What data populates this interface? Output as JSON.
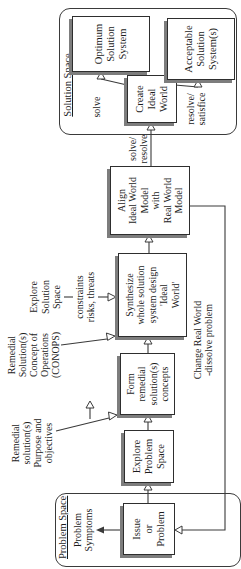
{
  "diagram": {
    "problem_space": {
      "title": "Problem Space"
    },
    "solution_space": {
      "title": "Solution Space"
    },
    "boxes": {
      "issue": "Issue\nor\nProblem",
      "explore_problem": "Explore\nProblem\nSpace",
      "form": "Form\nremedial\nsolution(s)\nconcepts",
      "synthesize": "Synthesize\nwhole solution\nsystem design\n'Ideal\nWorld'",
      "align": "Align\nIdeal World\nModel\nwith\nReal World\nModel",
      "create": "Create\nIdeal\nWorld",
      "optimum": "Optimum\nSolution\nSystem",
      "acceptable": "Acceptable\nSolution\nSystem(s)"
    },
    "labels": {
      "problem_symptoms": "Problem\nSymptoms",
      "remedial_purpose": "Remedial\nsolution(s)\nPurpose and\nobjectives",
      "remedial_conops": "Remedial\nSolution(s)\nConcept of\nOperations\n(CONOPS)",
      "explore_solution": "Explore\nSolution\nSpace",
      "constraints": "constraints\nrisks, threats",
      "solve_resolve": "solve/\nresolve",
      "solve": "solve",
      "resolve_satisfice": "resolve/\nsatisfice",
      "change_real_world": "Change Real World\n-dissolve problem"
    },
    "icons": {
      "open_arrowhead": "hollow triangle",
      "filled_arrowhead": "solid triangle"
    },
    "colors": {
      "line": "#3a3a3a",
      "shadow": "#7d7d7d",
      "box_background": "#ffffff",
      "page_background": "#ffffff",
      "text": "#1c1c1c"
    }
  }
}
